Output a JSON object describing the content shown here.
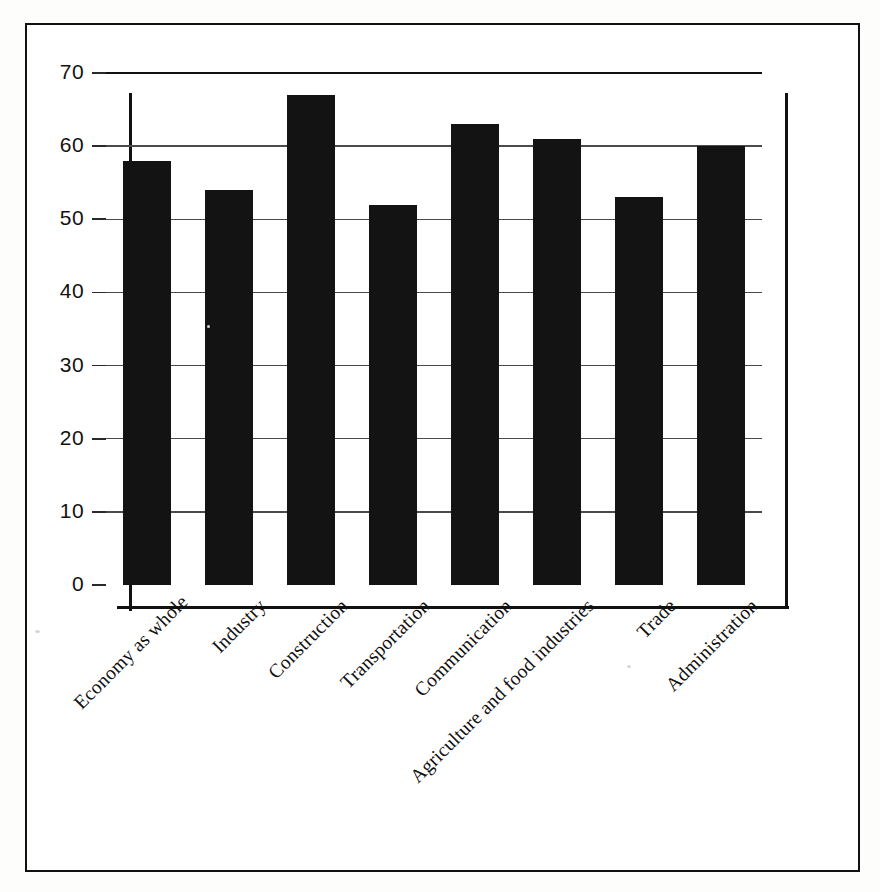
{
  "chart_data": {
    "type": "bar",
    "title": "",
    "subtitle": "",
    "xlabel": "",
    "ylabel": "",
    "ylim": [
      0,
      70
    ],
    "y_ticks": [
      0,
      10,
      20,
      30,
      40,
      50,
      60,
      70
    ],
    "grid": true,
    "legend": "none",
    "bar_color": "#131313",
    "label_rotation": -45,
    "categories": [
      "Economy as whole",
      "Industry",
      "Construction",
      "Transportation",
      "Communication",
      "Agriculture and food industries",
      "Trade",
      "Administration"
    ],
    "values": [
      58,
      54,
      67,
      52,
      63,
      61,
      53,
      60
    ]
  },
  "axes": {
    "y_tick_labels": [
      "70",
      "60",
      "50",
      "40",
      "30",
      "20",
      "10",
      "0"
    ]
  }
}
